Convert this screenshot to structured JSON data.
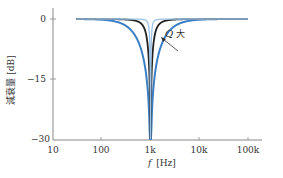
{
  "chart_data": {
    "type": "line",
    "title": "",
    "xlabel": "f [Hz]",
    "ylabel": "減衰量 [dB]",
    "x_scale": "log",
    "xlim": [
      10,
      300000
    ],
    "ylim": [
      -30,
      0
    ],
    "x_ticks": [
      10,
      100,
      1000,
      10000,
      100000
    ],
    "x_tick_labels": [
      "10",
      "100",
      "1k",
      "10k",
      "100k"
    ],
    "y_ticks": [
      0,
      -15,
      -30
    ],
    "y_tick_labels": [
      "0",
      "−15",
      "−30"
    ],
    "grid": false,
    "legend": null,
    "center_frequency_hz": 1000,
    "series": [
      {
        "name": "low Q (wide notch)",
        "color": "#3b7fc4",
        "Q": 0.5,
        "x_range": [
          30,
          100000
        ],
        "min_db": -30
      },
      {
        "name": "medium Q",
        "color": "#222222",
        "Q": 2,
        "x_range": [
          30,
          100000
        ],
        "min_db": -30
      },
      {
        "name": "high Q (narrow notch)",
        "color": "#9cc3e8",
        "Q": 8,
        "x_range": [
          30,
          100000
        ],
        "min_db": -30
      }
    ],
    "annotations": [
      {
        "text_symbol": "Q",
        "text": "大",
        "description": "arrow indicating increasing Q narrows notch",
        "x_hz": 3000,
        "y_db": -5
      }
    ]
  },
  "labels": {
    "y_axis": "減衰量 [dB]",
    "x_axis_symbol": "f",
    "x_axis_unit": "[Hz]",
    "annot_q": "Q",
    "annot_big": "大",
    "yticks": [
      "0",
      "−15",
      "−30"
    ],
    "xticks": [
      "10",
      "100",
      "1k",
      "10k",
      "100k"
    ]
  }
}
